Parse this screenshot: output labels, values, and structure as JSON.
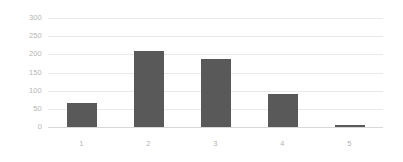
{
  "chart_data": {
    "type": "bar",
    "title": "",
    "subtitle": "",
    "xlabel": "",
    "ylabel": "",
    "categories": [
      "1",
      "2",
      "3",
      "4",
      "5"
    ],
    "values": [
      66,
      208,
      186,
      90,
      6
    ],
    "series": [
      {
        "name": "Series 1",
        "values": [
          66,
          208,
          186,
          90,
          6
        ]
      }
    ],
    "ylim": [
      0,
      300
    ],
    "yticks": [
      0,
      50,
      100,
      150,
      200,
      250,
      300
    ],
    "ytick_labels": [
      "0",
      "50",
      "100",
      "150",
      "200",
      "250",
      "300"
    ],
    "grid": "horizontal",
    "legend": "none",
    "annotations": [],
    "colors": {
      "bar": "#595959",
      "gridline": "#e9e9e9",
      "baseline": "#d8d8d8",
      "tick_label": "#b4b4b4",
      "background": "#ffffff"
    }
  }
}
